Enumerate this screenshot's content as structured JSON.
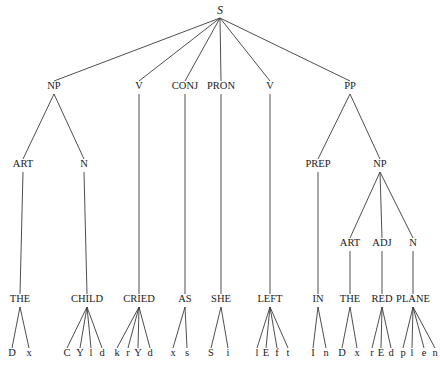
{
  "diagram": {
    "type": "parse-tree",
    "sentence": "THE CHILD CRIED AS SHE LEFT IN THE RED PLANE",
    "nodes": [
      {
        "id": "S",
        "label": "S",
        "x": 220,
        "y": 11,
        "class": "root"
      },
      {
        "id": "NP1",
        "label": "NP",
        "x": 54,
        "y": 87,
        "parent": "S"
      },
      {
        "id": "V1",
        "label": "V",
        "x": 139,
        "y": 87,
        "parent": "S"
      },
      {
        "id": "CONJ",
        "label": "CONJ",
        "x": 185,
        "y": 87,
        "parent": "S"
      },
      {
        "id": "PRON",
        "label": "PRON",
        "x": 221,
        "y": 87,
        "parent": "S"
      },
      {
        "id": "V2",
        "label": "V",
        "x": 270,
        "y": 87,
        "parent": "S"
      },
      {
        "id": "PP",
        "label": "PP",
        "x": 350,
        "y": 87,
        "parent": "S"
      },
      {
        "id": "ART1",
        "label": "ART",
        "x": 23,
        "y": 165,
        "parent": "NP1"
      },
      {
        "id": "N1",
        "label": "N",
        "x": 84,
        "y": 165,
        "parent": "NP1"
      },
      {
        "id": "PREP",
        "label": "PREP",
        "x": 318,
        "y": 165,
        "parent": "PP"
      },
      {
        "id": "NP2",
        "label": "NP",
        "x": 380,
        "y": 165,
        "parent": "PP"
      },
      {
        "id": "ART2",
        "label": "ART",
        "x": 350,
        "y": 244,
        "parent": "NP2"
      },
      {
        "id": "ADJ",
        "label": "ADJ",
        "x": 382,
        "y": 244,
        "parent": "NP2"
      },
      {
        "id": "N2",
        "label": "N",
        "x": 413,
        "y": 244,
        "parent": "NP2"
      },
      {
        "id": "W_THE1",
        "label": "THE",
        "x": 20,
        "y": 300,
        "parent": "ART1"
      },
      {
        "id": "W_CHILD",
        "label": "CHILD",
        "x": 87,
        "y": 300,
        "parent": "N1"
      },
      {
        "id": "W_CRIED",
        "label": "CRIED",
        "x": 139,
        "y": 300,
        "parent": "V1"
      },
      {
        "id": "W_AS",
        "label": "AS",
        "x": 185,
        "y": 300,
        "parent": "CONJ"
      },
      {
        "id": "W_SHE",
        "label": "SHE",
        "x": 221,
        "y": 300,
        "parent": "PRON"
      },
      {
        "id": "W_LEFT",
        "label": "LEFT",
        "x": 270,
        "y": 300,
        "parent": "V2"
      },
      {
        "id": "W_IN",
        "label": "IN",
        "x": 318,
        "y": 300,
        "parent": "PREP"
      },
      {
        "id": "W_THE2",
        "label": "THE",
        "x": 350,
        "y": 300,
        "parent": "ART2"
      },
      {
        "id": "W_RED",
        "label": "RED",
        "x": 382,
        "y": 300,
        "parent": "ADJ"
      },
      {
        "id": "W_PLANE",
        "label": "PLANE",
        "x": 413,
        "y": 300,
        "parent": "N2"
      }
    ],
    "phonemes": [
      {
        "word": "W_THE1",
        "items": [
          {
            "label": "D",
            "x": 12
          },
          {
            "label": "x",
            "x": 29
          }
        ]
      },
      {
        "word": "W_CHILD",
        "items": [
          {
            "label": "C",
            "x": 67
          },
          {
            "label": "Y",
            "x": 80
          },
          {
            "label": "l",
            "x": 91
          },
          {
            "label": "d",
            "x": 102
          }
        ]
      },
      {
        "word": "W_CRIED",
        "items": [
          {
            "label": "k",
            "x": 117
          },
          {
            "label": "r",
            "x": 128
          },
          {
            "label": "Y",
            "x": 138
          },
          {
            "label": "d",
            "x": 150
          }
        ]
      },
      {
        "word": "W_AS",
        "items": [
          {
            "label": "x",
            "x": 173
          },
          {
            "label": "s",
            "x": 187
          }
        ]
      },
      {
        "word": "W_SHE",
        "items": [
          {
            "label": "S",
            "x": 211
          },
          {
            "label": "i",
            "x": 228
          }
        ]
      },
      {
        "word": "W_LEFT",
        "items": [
          {
            "label": "l",
            "x": 257
          },
          {
            "label": "E",
            "x": 266
          },
          {
            "label": "f",
            "x": 277
          },
          {
            "label": "t",
            "x": 288
          }
        ]
      },
      {
        "word": "W_IN",
        "items": [
          {
            "label": "I",
            "x": 313
          },
          {
            "label": "n",
            "x": 326
          }
        ]
      },
      {
        "word": "W_THE2",
        "items": [
          {
            "label": "D",
            "x": 342
          },
          {
            "label": "x",
            "x": 357
          }
        ]
      },
      {
        "word": "W_RED",
        "items": [
          {
            "label": "r",
            "x": 372
          },
          {
            "label": "E",
            "x": 381
          },
          {
            "label": "d",
            "x": 391
          }
        ]
      },
      {
        "word": "W_PLANE",
        "items": [
          {
            "label": "p",
            "x": 403
          },
          {
            "label": "l",
            "x": 412
          },
          {
            "label": "e",
            "x": 424
          },
          {
            "label": "n",
            "x": 435
          }
        ]
      }
    ],
    "phoneme_y": 354,
    "colors": {
      "line": "#3a3a3a",
      "text": "#1a1a1a",
      "background": "#ffffff"
    }
  }
}
